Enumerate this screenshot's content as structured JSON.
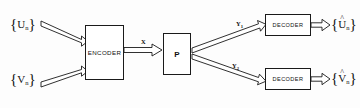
{
  "diagram": {
    "stroke_color": "#1a1a1a",
    "background_color": "#fdfdfd",
    "nodes": [
      {
        "id": "encoder",
        "label": "ENCODER"
      },
      {
        "id": "channel",
        "label": "P"
      },
      {
        "id": "decoder_top",
        "label": "DECODER"
      },
      {
        "id": "decoder_bottom",
        "label": "DECODER"
      }
    ],
    "signals": {
      "input_u": {
        "open": "{",
        "symbol": "U",
        "sub": "n",
        "close": "}"
      },
      "input_v": {
        "open": "{",
        "symbol": "V",
        "sub": "n",
        "close": "}"
      },
      "output_u_hat": {
        "open": "{",
        "symbol": "U",
        "hat": "^",
        "sub": "n",
        "close": "}"
      },
      "output_v_hat": {
        "open": "{",
        "symbol": "V",
        "hat": "^",
        "sub": "n",
        "close": "}"
      }
    },
    "edge_labels": {
      "x": {
        "symbol": "X",
        "sub": ""
      },
      "y1": {
        "symbol": "Y",
        "sub": "1"
      },
      "y2": {
        "symbol": "Y",
        "sub": "2"
      }
    }
  }
}
